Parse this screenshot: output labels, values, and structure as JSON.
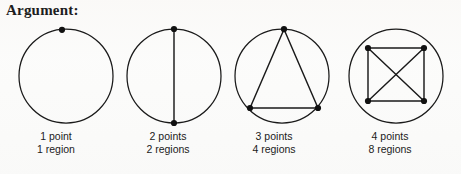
{
  "heading": "Argument:",
  "colors": {
    "background": "#fbfbfa",
    "ink": "#1a1a1a",
    "vertex": "#111111",
    "text": "#1b1b1b"
  },
  "figures": [
    {
      "id": "figure-1-point",
      "points_label": "1 point",
      "regions_label": "1 region",
      "point_count": 1,
      "region_count": 1,
      "circle": {
        "cx": 56,
        "cy": 56,
        "r": 47
      },
      "vertices": [
        {
          "x": 52,
          "y": 9.8
        }
      ],
      "chords": []
    },
    {
      "id": "figure-2-points",
      "points_label": "2 points",
      "regions_label": "2 regions",
      "point_count": 2,
      "region_count": 2,
      "circle": {
        "cx": 56,
        "cy": 56,
        "r": 47
      },
      "vertices": [
        {
          "x": 56,
          "y": 9
        },
        {
          "x": 56,
          "y": 103
        }
      ],
      "chords": [
        {
          "x1": 56,
          "y1": 9,
          "x2": 56,
          "y2": 103
        }
      ]
    },
    {
      "id": "figure-3-points",
      "points_label": "3 points",
      "regions_label": "4 regions",
      "point_count": 3,
      "region_count": 4,
      "circle": {
        "cx": 56,
        "cy": 56,
        "r": 47
      },
      "vertices": [
        {
          "x": 58,
          "y": 9.2
        },
        {
          "x": 24,
          "y": 88
        },
        {
          "x": 92,
          "y": 88
        }
      ],
      "chords": [
        {
          "x1": 58,
          "y1": 9.2,
          "x2": 24,
          "y2": 88
        },
        {
          "x1": 58,
          "y1": 9.2,
          "x2": 92,
          "y2": 88
        },
        {
          "x1": 24,
          "y1": 88,
          "x2": 92,
          "y2": 88
        }
      ]
    },
    {
      "id": "figure-4-points",
      "points_label": "4 points",
      "regions_label": "8 regions",
      "point_count": 4,
      "region_count": 8,
      "circle": {
        "cx": 56,
        "cy": 56,
        "r": 47
      },
      "vertices": [
        {
          "x": 28,
          "y": 28
        },
        {
          "x": 84,
          "y": 28
        },
        {
          "x": 28,
          "y": 81
        },
        {
          "x": 84,
          "y": 81
        }
      ],
      "chords": [
        {
          "x1": 28,
          "y1": 28,
          "x2": 84,
          "y2": 28
        },
        {
          "x1": 28,
          "y1": 28,
          "x2": 28,
          "y2": 81
        },
        {
          "x1": 84,
          "y1": 28,
          "x2": 84,
          "y2": 81
        },
        {
          "x1": 28,
          "y1": 81,
          "x2": 84,
          "y2": 81
        },
        {
          "x1": 28,
          "y1": 28,
          "x2": 84,
          "y2": 81
        },
        {
          "x1": 84,
          "y1": 28,
          "x2": 28,
          "y2": 81
        }
      ]
    }
  ]
}
